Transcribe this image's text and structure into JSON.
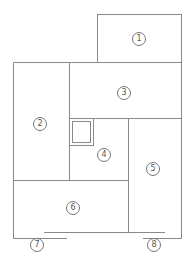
{
  "diagram": {
    "type": "floor-plan",
    "line_color": "#8a8a8a",
    "rooms": [
      {
        "id": "1",
        "label": "①",
        "x": 139,
        "y": 39
      },
      {
        "id": "2",
        "label": "②",
        "x": 40,
        "y": 124
      },
      {
        "id": "3",
        "label": "③",
        "x": 124,
        "y": 93
      },
      {
        "id": "4",
        "label": "④",
        "x": 104,
        "y": 155
      },
      {
        "id": "5",
        "label": "⑤",
        "x": 153,
        "y": 169
      },
      {
        "id": "6",
        "label": "⑥",
        "x": 73,
        "y": 208
      },
      {
        "id": "7",
        "label": "⑦",
        "x": 37,
        "y": 245
      },
      {
        "id": "8",
        "label": "⑧",
        "x": 154,
        "y": 245
      }
    ]
  }
}
